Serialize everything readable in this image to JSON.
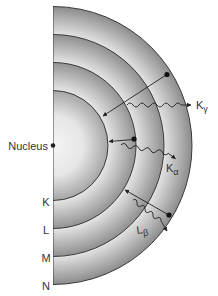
{
  "diagram": {
    "nucleus_label": "Nucleus",
    "shells": [
      {
        "name": "K",
        "label": "K"
      },
      {
        "name": "L",
        "label": "L"
      },
      {
        "name": "M",
        "label": "M"
      },
      {
        "name": "N",
        "label": "N"
      }
    ],
    "transitions": [
      {
        "from": "N",
        "to": "K",
        "emission_label": "K",
        "emission_subscript": "γ"
      },
      {
        "from": "L",
        "to": "K",
        "emission_label": "K",
        "emission_subscript": "α"
      },
      {
        "from": "N",
        "to": "L",
        "emission_label": "L",
        "emission_subscript": "β"
      }
    ],
    "colors": {
      "shell_dark": "#8a8a8a",
      "shell_light": "#e6e6e6",
      "line": "#222222",
      "text": "#333333"
    }
  }
}
